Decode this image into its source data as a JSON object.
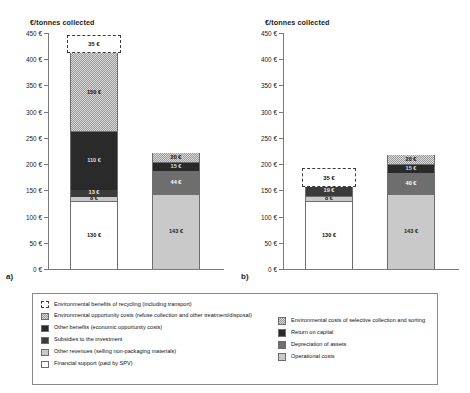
{
  "figure": {
    "panels": [
      {
        "letter": "a)",
        "axis_title": "€/tonnes collected"
      },
      {
        "letter": "b)",
        "axis_title": "€/tonnes collected"
      }
    ]
  },
  "legend": {
    "left_items": [
      {
        "label": "Environmental benefits of recycling (including transport)",
        "swatch": "dashed-outline"
      },
      {
        "label": "Environmental opportunity costs (refuse collection and other treatment/disposal)",
        "swatch": "checker-light"
      },
      {
        "label": "Other benefits (economic opportunity costs)",
        "swatch": "very-dark-grey"
      },
      {
        "label": "Subsidies to the investment",
        "swatch": "dark-grey"
      },
      {
        "label": "Other revenues (selling non-packaging materials)",
        "swatch": "light-grey"
      },
      {
        "label": "Financial support (paid by SPV)",
        "swatch": "white"
      }
    ],
    "right_items": [
      {
        "label": "Environmental costs of selective collection and sorting",
        "swatch": "checker-light"
      },
      {
        "label": "Return on capital",
        "swatch": "very-dark-grey"
      },
      {
        "label": "Depreciation of assets",
        "swatch": "mid-grey"
      },
      {
        "label": "Operational costs",
        "swatch": "light-grey"
      }
    ]
  },
  "chart_data": [
    {
      "type": "bar",
      "title": "a)",
      "subtitle": "",
      "ylabel": "€/tonnes collected",
      "xlabel": "",
      "ylim": [
        0,
        450
      ],
      "ytick_step": 50,
      "ytick_labels": [
        "0 €",
        "50 €",
        "100 €",
        "150 €",
        "200 €",
        "250 €",
        "300 €",
        "350 €",
        "400 €",
        "450 €"
      ],
      "grid": false,
      "legend_position": "below-figure",
      "stacked": true,
      "categories": [
        "benefits-and-support",
        "costs"
      ],
      "series": [
        {
          "name": "benefits-and-support",
          "segments": [
            {
              "label": "130 €",
              "value": 130,
              "fill": "white",
              "legend": "Financial support (paid by SPV)"
            },
            {
              "label": "8 €",
              "value": 8,
              "fill": "light-grey",
              "legend": "Other revenues (selling non-packaging materials)"
            },
            {
              "label": "13 €",
              "value": 13,
              "fill": "dark-grey",
              "legend": "Subsidies to the investment"
            },
            {
              "label": "110 €",
              "value": 110,
              "fill": "very-dark-grey",
              "legend": "Other benefits (economic opportunity costs)"
            },
            {
              "label": "150 €",
              "value": 150,
              "fill": "checker-light",
              "legend": "Environmental opportunity costs (refuse collection and other treatment/disposal)"
            },
            {
              "label": "35 €",
              "value": 35,
              "fill": "dashed-outline",
              "legend": "Environmental benefits of recycling (including transport)"
            }
          ],
          "total": 446
        },
        {
          "name": "costs",
          "segments": [
            {
              "label": "143 €",
              "value": 143,
              "fill": "light-grey",
              "legend": "Operational costs"
            },
            {
              "label": "44 €",
              "value": 44,
              "fill": "mid-grey",
              "legend": "Depreciation of assets"
            },
            {
              "label": "15 €",
              "value": 15,
              "fill": "very-dark-grey",
              "legend": "Return on capital"
            },
            {
              "label": "20 €",
              "value": 20,
              "fill": "checker-light",
              "legend": "Environmental costs of selective collection and sorting"
            }
          ],
          "total": 222
        }
      ]
    },
    {
      "type": "bar",
      "title": "b)",
      "subtitle": "",
      "ylabel": "€/tonnes collected",
      "xlabel": "",
      "ylim": [
        0,
        450
      ],
      "ytick_step": 50,
      "ytick_labels": [
        "0 €",
        "50 €",
        "100 €",
        "150 €",
        "200 €",
        "250 €",
        "300 €",
        "350 €",
        "400 €",
        "450 €"
      ],
      "grid": false,
      "legend_position": "below-figure",
      "stacked": true,
      "categories": [
        "benefits-and-support",
        "costs"
      ],
      "series": [
        {
          "name": "benefits-and-support",
          "segments": [
            {
              "label": "130 €",
              "value": 130,
              "fill": "white",
              "legend": "Financial support (paid by SPV)"
            },
            {
              "label": "8 €",
              "value": 8,
              "fill": "light-grey",
              "legend": "Other revenues (selling non-packaging materials)"
            },
            {
              "label": "19 €",
              "value": 19,
              "fill": "dark-grey",
              "legend": "Subsidies to the investment"
            },
            {
              "label": "35 €",
              "value": 35,
              "fill": "dashed-outline",
              "legend": "Environmental benefits of recycling (including transport)"
            }
          ],
          "total": 192
        },
        {
          "name": "costs",
          "segments": [
            {
              "label": "143 €",
              "value": 143,
              "fill": "light-grey",
              "legend": "Operational costs"
            },
            {
              "label": "40 €",
              "value": 40,
              "fill": "mid-grey",
              "legend": "Depreciation of assets"
            },
            {
              "label": "15 €",
              "value": 15,
              "fill": "very-dark-grey",
              "legend": "Return on capital"
            },
            {
              "label": "20 €",
              "value": 20,
              "fill": "checker-light",
              "legend": "Environmental costs of selective collection and sorting"
            }
          ],
          "total": 218
        }
      ]
    }
  ]
}
